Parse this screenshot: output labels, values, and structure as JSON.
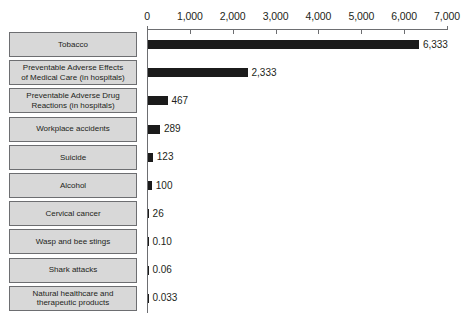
{
  "chart_data": {
    "type": "bar",
    "orientation": "horizontal",
    "title": "",
    "subtitle": "",
    "xlabel": "",
    "ylabel": "",
    "xlim": [
      0,
      7000
    ],
    "grid": false,
    "legend": null,
    "axis_tick_labels": [
      "0",
      "1,000",
      "2,000",
      "3,000",
      "4,000",
      "5,000",
      "6,000",
      "7,000"
    ],
    "axis_tick_values": [
      0,
      1000,
      2000,
      3000,
      4000,
      5000,
      6000,
      7000
    ],
    "categories": [
      "Tobacco",
      "Preventable Adverse Effects\nof Medical Care (in hospitals)",
      "Preventable Adverse Drug\nReactions (in hospitals)",
      "Workplace accidents",
      "Suicide",
      "Alcohol",
      "Cervical cancer",
      "Wasp and bee stings",
      "Shark attacks",
      "Natural healthcare and\ntherapeutic products"
    ],
    "values": [
      6333,
      2333,
      467,
      289,
      123,
      100,
      26,
      0.1,
      0.06,
      0.033
    ],
    "value_labels": [
      "6,333",
      "2,333",
      "467",
      "289",
      "123",
      "100",
      "26",
      "0.10",
      "0.06",
      "0.033"
    ],
    "colors": {
      "bar": "#1b1b1b",
      "box_fill": "#d8d8d8",
      "box_border": "#6d6e71",
      "axis": "#6d6e71",
      "text": "#231f20",
      "background": "#ffffff"
    }
  }
}
